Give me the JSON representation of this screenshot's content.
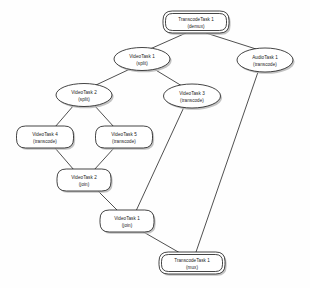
{
  "diagram": {
    "background_color": "#fefefe",
    "stroke_color": "#151515",
    "shadow_color": "#b9b9b9",
    "nodes": [
      {
        "id": "transcode-demux",
        "name": "TranscodeTask 1",
        "operation": "(demux)",
        "shape": "double-rounded-rect",
        "cx": 196,
        "cy": 22,
        "w": 66,
        "h": 22
      },
      {
        "id": "videotask1-split",
        "name": "VideoTask 1",
        "operation": "(split)",
        "shape": "ellipse",
        "cx": 142,
        "cy": 59,
        "w": 56,
        "h": 23
      },
      {
        "id": "audiotask1-transcode",
        "name": "AudioTask 1",
        "operation": "(transcode)",
        "shape": "ellipse",
        "cx": 265,
        "cy": 60,
        "w": 56,
        "h": 24
      },
      {
        "id": "videotask2-split",
        "name": "VideoTask 2",
        "operation": "(split)",
        "shape": "ellipse",
        "cx": 84,
        "cy": 95,
        "w": 56,
        "h": 23
      },
      {
        "id": "videotask3-transcode",
        "name": "VideoTask 3",
        "operation": "(transcode)",
        "shape": "ellipse",
        "cx": 192,
        "cy": 96,
        "w": 57,
        "h": 24
      },
      {
        "id": "videotask4-transcode",
        "name": "VideoTask 4",
        "operation": "(transcode)",
        "shape": "rounded-rect",
        "cx": 45,
        "cy": 137,
        "w": 57,
        "h": 22
      },
      {
        "id": "videotask5-transcode",
        "name": "VideoTask 5",
        "operation": "(transcode)",
        "shape": "rounded-rect",
        "cx": 124,
        "cy": 137,
        "w": 57,
        "h": 22
      },
      {
        "id": "videotask2-join",
        "name": "VideoTask 2",
        "operation": "(join)",
        "shape": "rounded-rect",
        "cx": 84,
        "cy": 180,
        "w": 54,
        "h": 22
      },
      {
        "id": "videotask1-join",
        "name": "VideoTask 1",
        "operation": "(join)",
        "shape": "rounded-rect",
        "cx": 127,
        "cy": 221,
        "w": 54,
        "h": 22
      },
      {
        "id": "transcode-mux",
        "name": "TranscodeTask 1",
        "operation": "(mux)",
        "shape": "double-rounded-rect",
        "cx": 192,
        "cy": 263,
        "w": 66,
        "h": 22
      }
    ],
    "edges": [
      {
        "id": "e1",
        "from": "transcode-demux",
        "to": "videotask1-split",
        "x1": 186,
        "y1": 33,
        "x2": 150,
        "y2": 49
      },
      {
        "id": "e2",
        "from": "transcode-demux",
        "to": "audiotask1-transcode",
        "x1": 206,
        "y1": 33,
        "x2": 256,
        "y2": 49
      },
      {
        "id": "e3",
        "from": "videotask1-split",
        "to": "videotask2-split",
        "x1": 130,
        "y1": 69,
        "x2": 96,
        "y2": 85
      },
      {
        "id": "e4",
        "from": "videotask1-split",
        "to": "videotask3-transcode",
        "x1": 154,
        "y1": 69,
        "x2": 182,
        "y2": 86
      },
      {
        "id": "e5",
        "from": "videotask2-split",
        "to": "videotask4-transcode",
        "x1": 74,
        "y1": 105,
        "x2": 55,
        "y2": 127
      },
      {
        "id": "e6",
        "from": "videotask2-split",
        "to": "videotask5-transcode",
        "x1": 94,
        "y1": 105,
        "x2": 114,
        "y2": 127
      },
      {
        "id": "e7",
        "from": "videotask4-transcode",
        "to": "videotask2-join",
        "x1": 55,
        "y1": 148,
        "x2": 74,
        "y2": 170
      },
      {
        "id": "e8",
        "from": "videotask5-transcode",
        "to": "videotask2-join",
        "x1": 114,
        "y1": 148,
        "x2": 94,
        "y2": 170
      },
      {
        "id": "e9",
        "from": "videotask2-join",
        "to": "videotask1-join",
        "x1": 96,
        "y1": 189,
        "x2": 118,
        "y2": 211
      },
      {
        "id": "e10",
        "from": "videotask3-transcode",
        "to": "videotask1-join",
        "x1": 184,
        "y1": 107,
        "x2": 136,
        "y2": 211
      },
      {
        "id": "e11",
        "from": "videotask1-join",
        "to": "transcode-mux",
        "x1": 140,
        "y1": 230,
        "x2": 180,
        "y2": 253
      },
      {
        "id": "e12",
        "from": "audiotask1-transcode",
        "to": "transcode-mux",
        "x1": 258,
        "y1": 72,
        "x2": 196,
        "y2": 252
      }
    ]
  }
}
